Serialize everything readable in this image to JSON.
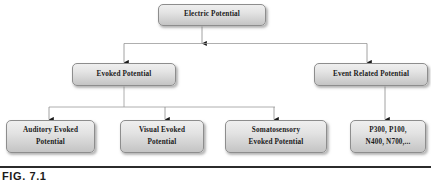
{
  "figure": {
    "caption": "FIG. 7.1"
  },
  "colors": {
    "box_fill_top": "#efefef",
    "box_fill_bottom": "#c4c4c4",
    "box_border": "#8d8d8d",
    "connector": "#7a7a7a",
    "arrow": "#1a1a1a",
    "text": "#1a1a1a",
    "caption_rule": "#2b2b2b",
    "background": "#ffffff"
  },
  "nodes": {
    "root": {
      "label": "Electric Potential"
    },
    "evoked_potential": {
      "label": "Evoked Potential"
    },
    "event_related_potential": {
      "label": "Event Related Potential"
    },
    "auditory_evoked_potential": {
      "line1": "Auditory Evoked",
      "line2": "Potential"
    },
    "visual_evoked_potential": {
      "line1": "Visual Evoked",
      "line2": "Potential"
    },
    "somatosensory_evoked_potential": {
      "line1": "Somatosensory",
      "line2": "Evoked Potential"
    },
    "erp_components": {
      "line1": "P300, P100,",
      "line2": "N400, N700,..."
    }
  }
}
